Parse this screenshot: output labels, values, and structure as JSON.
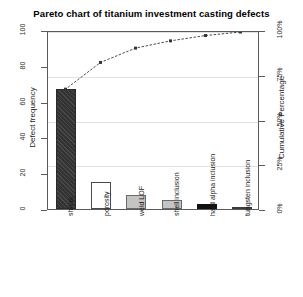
{
  "chart_data": {
    "type": "bar",
    "title": "Pareto chart of titanium investment casting defects",
    "xlabel": "",
    "ylabel": "Defect frequency",
    "y2label": "Cumulative Percentage",
    "categories": [
      "shrink",
      "porosity",
      "weld LOF",
      "shell inclusion",
      "hard alpha inclusion",
      "tungsten inclusion"
    ],
    "values": [
      67,
      15,
      8,
      5,
      3,
      1
    ],
    "cumulative_percent": [
      67.7,
      82.8,
      90.9,
      95.0,
      98.0,
      100.0
    ],
    "ylim": [
      0,
      100
    ],
    "y2lim": [
      0,
      100
    ],
    "yticks": [
      0,
      20,
      40,
      60,
      80,
      100
    ],
    "ytick_labels": [
      "0",
      "20",
      "40",
      "60",
      "80",
      "100"
    ],
    "y2ticks": [
      0,
      25,
      50,
      75,
      100
    ],
    "y2tick_labels": [
      "0%",
      "25%",
      "50%",
      "75%",
      "100%"
    ],
    "grid": true,
    "legend": "none",
    "bar_styles": [
      "hatch-dark",
      "white",
      "gray",
      "gray",
      "black",
      "dark"
    ],
    "line_color": "#333333",
    "line_style": "dashed-with-points",
    "frame_color": "#5b5b5b",
    "grid_color": "#e2e2e2",
    "background": "#ffffff"
  }
}
